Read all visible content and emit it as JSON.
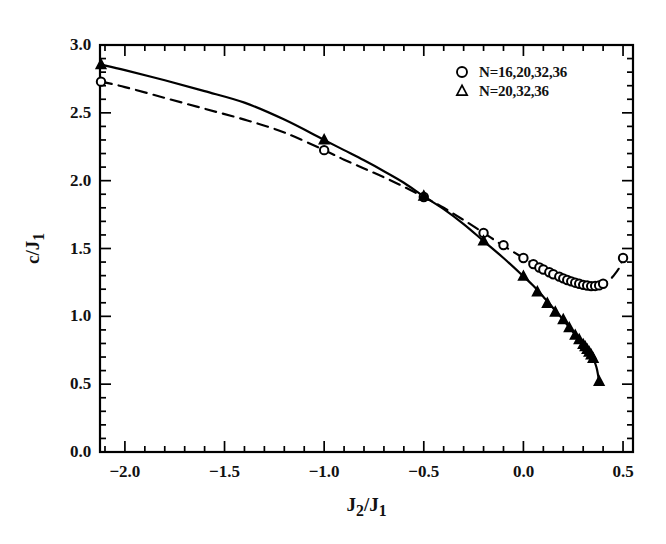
{
  "chart_data": {
    "type": "line",
    "title": "",
    "subtitle": "",
    "xlabel": "J2/J1",
    "ylabel": "c/J1",
    "xlabel_rich": {
      "base1": "J",
      "sub1": "2",
      "slash": "/",
      "base2": "J",
      "sub2": "1"
    },
    "ylabel_rich": {
      "base1": "c",
      "slash": "/",
      "base2": "J",
      "sub2": "1"
    },
    "xlim": [
      -2.125,
      0.55
    ],
    "ylim": [
      0.0,
      3.0
    ],
    "xticks": [
      -2.0,
      -1.5,
      -1.0,
      -0.5,
      0.0,
      0.5
    ],
    "xticklabels": [
      "-2.0",
      "-1.5",
      "-1.0",
      "-0.5",
      "0.0",
      "0.5"
    ],
    "yticks": [
      0.0,
      0.5,
      1.0,
      1.5,
      2.0,
      2.5,
      3.0
    ],
    "yticklabels": [
      "0.0",
      "0.5",
      "1.0",
      "1.5",
      "2.0",
      "2.5",
      "3.0"
    ],
    "x_minor_step": 0.1,
    "y_minor_step": 0.1,
    "grid": false,
    "frame": true,
    "ticks_direction": "in",
    "legend_position": "top-right",
    "legend": [
      {
        "marker": "circle",
        "filled": false,
        "label": "N=16,20,32,36"
      },
      {
        "marker": "triangle",
        "filled": false,
        "label": "N=20,32,36"
      }
    ],
    "series": [
      {
        "name": "N=16,20,32,36",
        "marker": "circle",
        "marker_filled": false,
        "linestyle": "dashed",
        "color": "#000000",
        "line": [
          [
            -2.12,
            2.73
          ],
          [
            -2.0,
            2.69
          ],
          [
            -1.8,
            2.61
          ],
          [
            -1.6,
            2.53
          ],
          [
            -1.4,
            2.45
          ],
          [
            -1.2,
            2.355
          ],
          [
            -1.0,
            2.225
          ],
          [
            -0.9,
            2.155
          ],
          [
            -0.8,
            2.09
          ],
          [
            -0.7,
            2.025
          ],
          [
            -0.6,
            1.955
          ],
          [
            -0.5,
            1.88
          ],
          [
            -0.4,
            1.8
          ],
          [
            -0.3,
            1.71
          ],
          [
            -0.2,
            1.615
          ],
          [
            -0.1,
            1.52
          ],
          [
            0.0,
            1.43
          ],
          [
            0.05,
            1.385
          ],
          [
            0.1,
            1.345
          ],
          [
            0.15,
            1.31
          ],
          [
            0.2,
            1.28
          ],
          [
            0.25,
            1.253
          ],
          [
            0.28,
            1.24
          ],
          [
            0.3,
            1.232
          ],
          [
            0.33,
            1.225
          ],
          [
            0.35,
            1.223
          ],
          [
            0.38,
            1.228
          ],
          [
            0.4,
            1.24
          ],
          [
            0.43,
            1.265
          ],
          [
            0.45,
            1.295
          ],
          [
            0.48,
            1.355
          ],
          [
            0.5,
            1.43
          ]
        ],
        "points": [
          [
            -2.12,
            2.73
          ],
          [
            -1.0,
            2.225
          ],
          [
            -0.5,
            1.88
          ],
          [
            -0.2,
            1.615
          ],
          [
            -0.1,
            1.525
          ],
          [
            0.0,
            1.43
          ],
          [
            0.05,
            1.385
          ],
          [
            0.08,
            1.36
          ],
          [
            0.1,
            1.345
          ],
          [
            0.13,
            1.325
          ],
          [
            0.15,
            1.31
          ],
          [
            0.18,
            1.293
          ],
          [
            0.2,
            1.28
          ],
          [
            0.22,
            1.268
          ],
          [
            0.24,
            1.258
          ],
          [
            0.26,
            1.248
          ],
          [
            0.28,
            1.24
          ],
          [
            0.3,
            1.232
          ],
          [
            0.32,
            1.227
          ],
          [
            0.34,
            1.223
          ],
          [
            0.36,
            1.224
          ],
          [
            0.38,
            1.228
          ],
          [
            0.4,
            1.24
          ],
          [
            0.5,
            1.43
          ]
        ]
      },
      {
        "name": "N=20,32,36",
        "marker": "triangle",
        "marker_filled": true,
        "linestyle": "solid",
        "color": "#000000",
        "line": [
          [
            -2.12,
            2.855
          ],
          [
            -2.0,
            2.815
          ],
          [
            -1.8,
            2.74
          ],
          [
            -1.6,
            2.66
          ],
          [
            -1.4,
            2.575
          ],
          [
            -1.2,
            2.45
          ],
          [
            -1.0,
            2.3
          ],
          [
            -0.9,
            2.225
          ],
          [
            -0.8,
            2.15
          ],
          [
            -0.7,
            2.07
          ],
          [
            -0.6,
            1.985
          ],
          [
            -0.5,
            1.885
          ],
          [
            -0.4,
            1.79
          ],
          [
            -0.3,
            1.68
          ],
          [
            -0.2,
            1.555
          ],
          [
            -0.1,
            1.43
          ],
          [
            0.0,
            1.295
          ],
          [
            0.05,
            1.225
          ],
          [
            0.1,
            1.145
          ],
          [
            0.15,
            1.06
          ],
          [
            0.2,
            0.975
          ],
          [
            0.24,
            0.9
          ],
          [
            0.27,
            0.845
          ],
          [
            0.29,
            0.81
          ],
          [
            0.31,
            0.775
          ],
          [
            0.33,
            0.735
          ],
          [
            0.34,
            0.715
          ],
          [
            0.35,
            0.69
          ],
          [
            0.36,
            0.655
          ],
          [
            0.37,
            0.605
          ],
          [
            0.38,
            0.52
          ]
        ],
        "points": [
          [
            -2.12,
            2.855
          ],
          [
            -1.0,
            2.3
          ],
          [
            -0.5,
            1.885
          ],
          [
            -0.2,
            1.555
          ],
          [
            0.0,
            1.295
          ],
          [
            0.07,
            1.18
          ],
          [
            0.12,
            1.095
          ],
          [
            0.16,
            1.03
          ],
          [
            0.2,
            0.975
          ],
          [
            0.23,
            0.915
          ],
          [
            0.26,
            0.86
          ],
          [
            0.28,
            0.828
          ],
          [
            0.3,
            0.792
          ],
          [
            0.31,
            0.775
          ],
          [
            0.32,
            0.755
          ],
          [
            0.33,
            0.735
          ],
          [
            0.34,
            0.715
          ],
          [
            0.35,
            0.69
          ],
          [
            0.38,
            0.52
          ]
        ]
      }
    ]
  }
}
